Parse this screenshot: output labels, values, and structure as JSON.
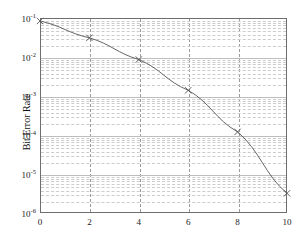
{
  "chart_data": {
    "type": "line",
    "title": "",
    "xlabel": "",
    "ylabel": "Bit Error Rate",
    "yscale": "log",
    "xlim": [
      0,
      10
    ],
    "ylim": [
      1e-06,
      0.1
    ],
    "grid": true,
    "legend": null,
    "marker": "x",
    "line_color": "#555555",
    "x": [
      0,
      2,
      4,
      6,
      8,
      10
    ],
    "values": [
      0.084,
      0.031,
      0.0086,
      0.0014,
      0.00012,
      3.2e-06
    ],
    "series": [
      {
        "name": "Bit Error Rate",
        "x": [
          0,
          2,
          4,
          6,
          8,
          10
        ],
        "values": [
          0.084,
          0.031,
          0.0086,
          0.0014,
          0.00012,
          3.2e-06
        ]
      }
    ],
    "xticks": [
      "0",
      "2",
      "4",
      "6",
      "8",
      "10"
    ],
    "xtick_values": [
      0,
      2,
      4,
      6,
      8,
      10
    ],
    "yticks": [
      "10-1",
      "10-2",
      "10-3",
      "10-4",
      "10-5",
      "10-6"
    ],
    "ytick_bases": [
      "10",
      "10",
      "10",
      "10",
      "10",
      "10"
    ],
    "ytick_exponents": [
      "-1",
      "-2",
      "-3",
      "-4",
      "-5",
      "-6"
    ],
    "ytick_values": [
      0.1,
      0.01,
      0.001,
      0.0001,
      1e-05,
      1e-06
    ]
  }
}
